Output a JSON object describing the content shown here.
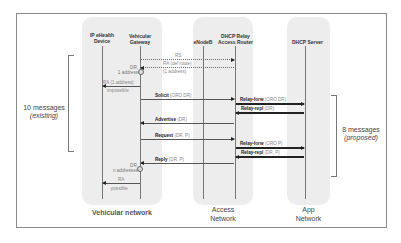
{
  "diagram": {
    "type": "sequence",
    "zones": [
      {
        "id": "vehicular",
        "label": "Vehicular network"
      },
      {
        "id": "access",
        "label_line1": "Access",
        "label_line2": "Network"
      },
      {
        "id": "app",
        "label_line1": "App",
        "label_line2": "Network"
      }
    ],
    "entities": [
      {
        "id": "device",
        "line1": "IP eHealth",
        "line2": "Device"
      },
      {
        "id": "gateway",
        "line1": "Vehicular",
        "line2": "Gateway"
      },
      {
        "id": "enodeb",
        "line1": "eNodeB"
      },
      {
        "id": "relay",
        "line1": "DHCP Relay",
        "line2": "Access Router"
      },
      {
        "id": "server",
        "line1": "DHCP Server"
      }
    ],
    "messages": [
      {
        "name": "RS",
        "params": "",
        "from": "gateway",
        "to": "relay",
        "style": "dotted"
      },
      {
        "name": "RA (def route)",
        "params": "",
        "line2": "(1 address)",
        "from": "relay",
        "to": "gateway",
        "style": "dotted"
      },
      {
        "name": "RA (1 address)",
        "params": "",
        "line2": "impossible",
        "from": "gateway",
        "to": "device",
        "style": "thin"
      },
      {
        "name": "Solicit",
        "params": "(ORO DR)",
        "from": "gateway",
        "to": "relay",
        "style": "thin"
      },
      {
        "name": "Relay-forw",
        "params": "(ORO DR)",
        "from": "relay",
        "to": "server",
        "style": "bold"
      },
      {
        "name": "Relay-repl",
        "params": "(DR)",
        "from": "server",
        "to": "relay",
        "style": "bold"
      },
      {
        "name": "Advertise",
        "params": "(DR)",
        "from": "relay",
        "to": "gateway",
        "style": "thin"
      },
      {
        "name": "Request",
        "params": "(DR, P)",
        "from": "gateway",
        "to": "relay",
        "style": "thin"
      },
      {
        "name": "Relay-forw",
        "params": "(ORO P)",
        "from": "relay",
        "to": "server",
        "style": "bold"
      },
      {
        "name": "Relay-repl",
        "params": "(DR, P)",
        "from": "server",
        "to": "relay",
        "style": "bold"
      },
      {
        "name": "Reply",
        "params": "(DR, P)",
        "from": "relay",
        "to": "gateway",
        "style": "thin"
      },
      {
        "name": "RA",
        "params": "",
        "line2": "possible",
        "from": "gateway",
        "to": "device",
        "style": "thin"
      }
    ],
    "notes": [
      {
        "id": "dr1",
        "line1": "DR,",
        "line2": "1 address"
      },
      {
        "id": "dr2",
        "line1": "DR,",
        "line2": "n addresses"
      }
    ],
    "annotations": {
      "existing": {
        "line1": "10 messages",
        "line2": "(existing)"
      },
      "proposed": {
        "line1": "8 messages",
        "line2": "(proposed)"
      }
    }
  }
}
